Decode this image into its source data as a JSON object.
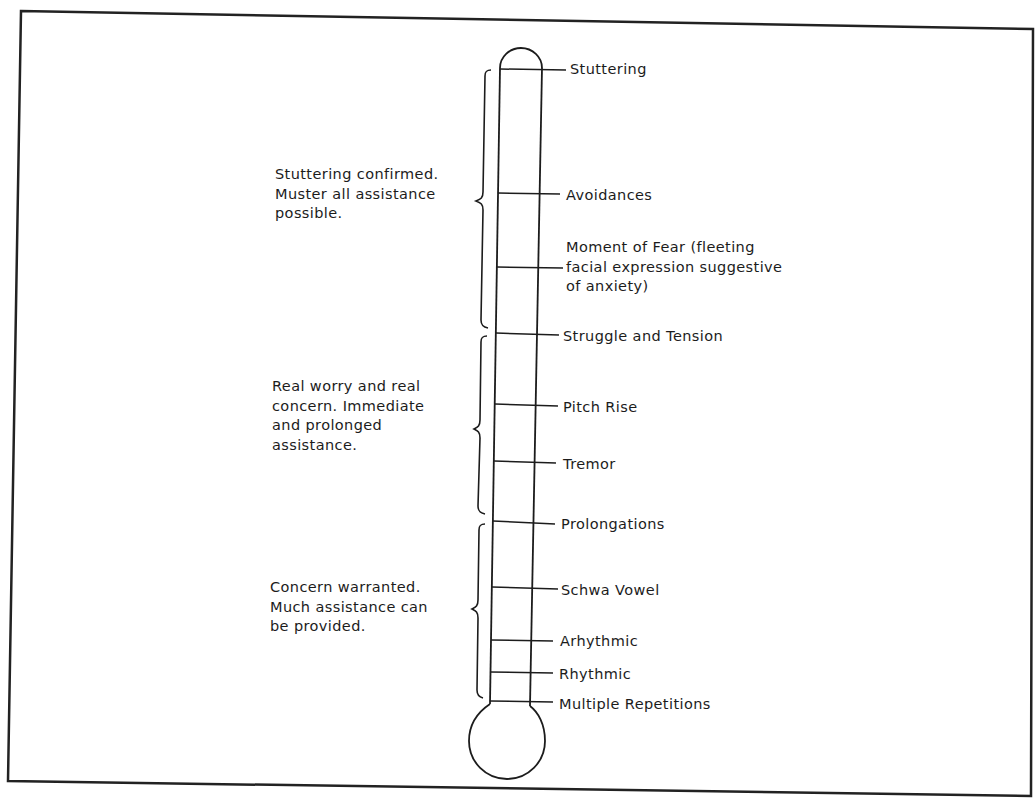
{
  "diagram": {
    "type": "thermometer-scale",
    "stages": [
      {
        "label": "Stuttering",
        "y": 69
      },
      {
        "label": "Avoidances",
        "y": 194
      },
      {
        "label_lines": [
          "Moment of Fear (fleeting",
          "facial expression suggestive",
          "of anxiety)"
        ],
        "y": 267
      },
      {
        "label": "Struggle and Tension",
        "y": 334
      },
      {
        "label": "Pitch Rise",
        "y": 405
      },
      {
        "label": "Tremor",
        "y": 462
      },
      {
        "label": "Prolongations",
        "y": 522
      },
      {
        "label": "Schwa Vowel",
        "y": 588
      },
      {
        "label": "Arhythmic",
        "y": 640
      },
      {
        "label": "Rhythmic",
        "y": 673
      },
      {
        "label": "Multiple Repetitions",
        "y": 702
      }
    ],
    "groups": [
      {
        "lines": [
          "Stuttering confirmed.",
          "Muster all assistance",
          "possible."
        ],
        "range": [
          "Stuttering",
          "Struggle and Tension"
        ]
      },
      {
        "lines": [
          "Real worry and real",
          "concern.  Immediate",
          "and prolonged",
          "assistance."
        ],
        "range": [
          "Struggle and Tension",
          "Prolongations"
        ]
      },
      {
        "lines": [
          "Concern warranted.",
          "Much assistance can",
          "be provided."
        ],
        "range": [
          "Prolongations",
          "Multiple Repetitions"
        ]
      }
    ],
    "colors": {
      "ink": "#1c1c1c",
      "background": "#ffffff"
    }
  }
}
